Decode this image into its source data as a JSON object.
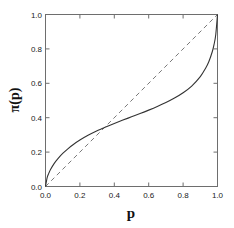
{
  "chart_data": {
    "type": "line",
    "title": "",
    "xlabel": "p",
    "ylabel": "π(p)",
    "xlim": [
      0.0,
      1.0
    ],
    "ylim": [
      0.0,
      1.0
    ],
    "grid": false,
    "legend": "none",
    "xticks": [
      "0.0",
      "0.2",
      "0.4",
      "0.6",
      "0.8",
      "1.0"
    ],
    "yticks": [
      "0.0",
      "0.2",
      "0.4",
      "0.6",
      "0.8",
      "1.0"
    ],
    "xtick_values": [
      0.0,
      0.2,
      0.4,
      0.6,
      0.8,
      1.0
    ],
    "ytick_values": [
      0.0,
      0.2,
      0.4,
      0.6,
      0.8,
      1.0
    ],
    "crossing_point": [
      0.33,
      0.33
    ],
    "series": [
      {
        "name": "weighting-function",
        "style": "solid",
        "color": "#333333",
        "x": [
          0.0,
          0.01,
          0.02,
          0.03,
          0.05,
          0.07,
          0.1,
          0.13,
          0.16,
          0.2,
          0.25,
          0.3,
          0.33,
          0.35,
          0.4,
          0.45,
          0.5,
          0.55,
          0.6,
          0.65,
          0.7,
          0.75,
          0.8,
          0.85,
          0.9,
          0.93,
          0.95,
          0.97,
          0.98,
          0.99,
          1.0
        ],
        "values": [
          0.0,
          0.053,
          0.079,
          0.1,
          0.133,
          0.159,
          0.192,
          0.219,
          0.243,
          0.27,
          0.299,
          0.324,
          0.337,
          0.346,
          0.366,
          0.386,
          0.405,
          0.424,
          0.444,
          0.465,
          0.488,
          0.514,
          0.545,
          0.584,
          0.639,
          0.686,
          0.727,
          0.785,
          0.826,
          0.884,
          1.0
        ]
      },
      {
        "name": "identity-diagonal",
        "style": "dashed",
        "color": "#7a7a7a",
        "x": [
          0.0,
          1.0
        ],
        "values": [
          0.0,
          1.0
        ]
      }
    ]
  },
  "axes": {
    "frame_color": "#6e6e6e",
    "tick_direction": "in",
    "spines": [
      "left",
      "right",
      "top",
      "bottom"
    ]
  }
}
